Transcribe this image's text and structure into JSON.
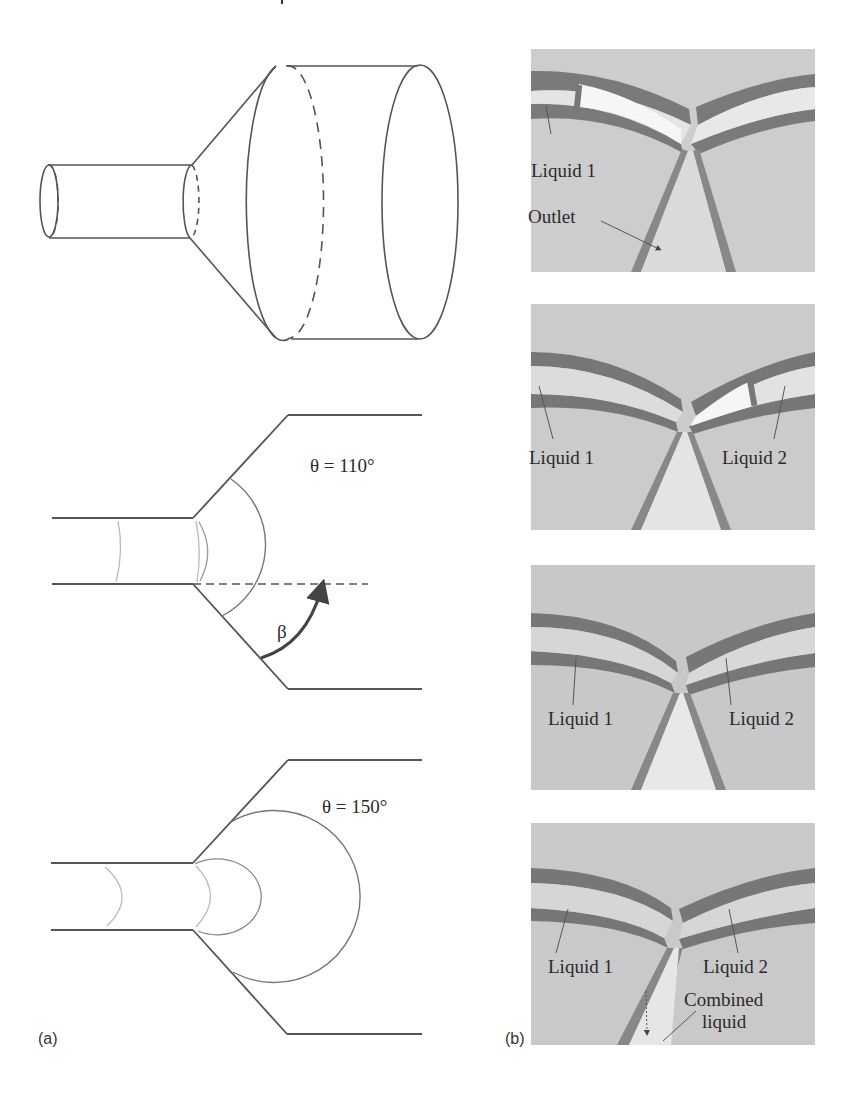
{
  "figure": {
    "panel_a": {
      "letter": "(a)",
      "diagrams": [
        {
          "name": "3d-converging-diverging-channel",
          "description": "cylindrical narrow tube expanding via a cone into a wide cylinder"
        },
        {
          "name": "meniscus-diagram-110",
          "angle_label": "θ = 110°",
          "beta_label": "β"
        },
        {
          "name": "meniscus-diagram-150",
          "angle_label": "θ = 150°"
        }
      ]
    },
    "panel_b": {
      "letter": "(b)",
      "photos": [
        {
          "labels": {
            "liquid1": "Liquid 1",
            "outlet": "Outlet"
          }
        },
        {
          "labels": {
            "liquid1": "Liquid 1",
            "liquid2": "Liquid 2"
          }
        },
        {
          "labels": {
            "liquid1": "Liquid 1",
            "liquid2": "Liquid 2"
          }
        },
        {
          "labels": {
            "liquid1": "Liquid 1",
            "liquid2": "Liquid 2",
            "combined_line1": "Combined",
            "combined_line2": "liquid"
          }
        }
      ]
    },
    "colors": {
      "line": "#555555",
      "light_line": "#b8b8b8",
      "photo_bg": "#c9c9c9",
      "channel_wall": "#6e6e6e",
      "channel_fill": "#e6e6e6"
    }
  }
}
